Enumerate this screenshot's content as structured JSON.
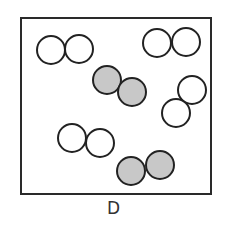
{
  "diagram": {
    "label": "D",
    "box": {
      "x": 21,
      "y": 18,
      "width": 190,
      "height": 176,
      "stroke": "#2a2a2a"
    },
    "colors": {
      "white_fill": "#ffffff",
      "gray_fill": "#c8c8c8",
      "stroke": "#222222"
    },
    "radius": 14,
    "molecules": [
      {
        "type": "white",
        "atoms": [
          {
            "cx": 51,
            "cy": 50
          },
          {
            "cx": 79,
            "cy": 49
          }
        ]
      },
      {
        "type": "white",
        "atoms": [
          {
            "cx": 157,
            "cy": 43
          },
          {
            "cx": 186,
            "cy": 42
          }
        ]
      },
      {
        "type": "gray",
        "atoms": [
          {
            "cx": 107,
            "cy": 80
          },
          {
            "cx": 132,
            "cy": 92
          }
        ]
      },
      {
        "type": "white",
        "atoms": [
          {
            "cx": 192,
            "cy": 90
          },
          {
            "cx": 176,
            "cy": 113
          }
        ]
      },
      {
        "type": "white",
        "atoms": [
          {
            "cx": 72,
            "cy": 138
          },
          {
            "cx": 100,
            "cy": 143
          }
        ]
      },
      {
        "type": "gray",
        "atoms": [
          {
            "cx": 131,
            "cy": 171
          },
          {
            "cx": 160,
            "cy": 165
          }
        ]
      }
    ]
  }
}
